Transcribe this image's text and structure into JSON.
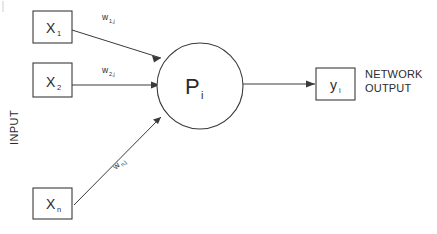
{
  "diagram": {
    "colors": {
      "stroke": "#3a3a3a",
      "text": "#2b2b2b",
      "background": "#ffffff",
      "tick": "#cfcfcf"
    },
    "input_group_label": "INPUT",
    "inputs": [
      {
        "id": "x1",
        "symbol": "X",
        "subscript": "1"
      },
      {
        "id": "x2",
        "symbol": "X",
        "subscript": "2"
      },
      {
        "id": "xn",
        "symbol": "X",
        "subscript": "n"
      }
    ],
    "weights": [
      {
        "id": "w1j",
        "symbol": "w",
        "subscript": "1,j"
      },
      {
        "id": "w2j",
        "symbol": "w",
        "subscript": "2,j"
      },
      {
        "id": "wnj",
        "symbol": "w",
        "subscript": "n,j"
      }
    ],
    "neuron": {
      "symbol": "P",
      "subscript": "i"
    },
    "output": {
      "symbol": "y",
      "subscript": "i",
      "label_line1": "NETWORK",
      "label_line2": "OUTPUT"
    }
  }
}
